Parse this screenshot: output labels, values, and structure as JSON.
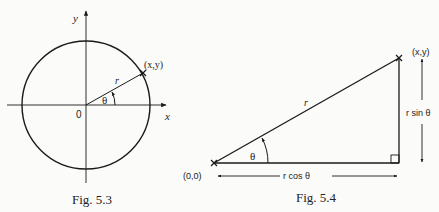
{
  "figures": [
    {
      "id": "fig53",
      "caption": "Fig. 5.3",
      "labels": {
        "y_axis": "y",
        "x_axis": "x",
        "origin": "0",
        "radius": "r",
        "angle": "θ",
        "point": "(x,y)"
      }
    },
    {
      "id": "fig54",
      "caption": "Fig. 5.4",
      "labels": {
        "origin": "(0,0)",
        "point": "(x,y)",
        "hypotenuse": "r",
        "angle": "θ",
        "opposite": "r sin θ",
        "adjacent": "r cos θ"
      }
    }
  ],
  "colors": {
    "line": "#1a1a1a",
    "background": "#fbfbfa"
  }
}
